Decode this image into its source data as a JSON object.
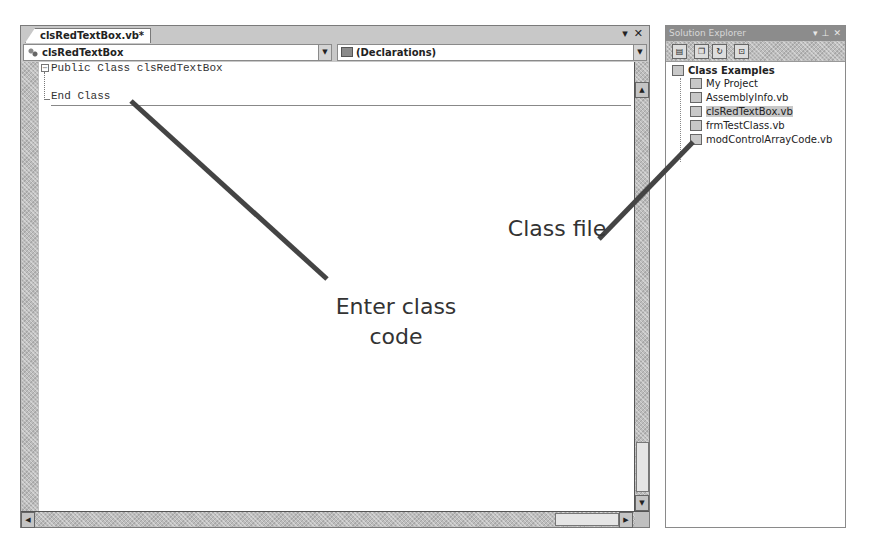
{
  "editor": {
    "tab_label": "clsRedTextBox.vb*",
    "tab_controls": {
      "dropdown": "▾",
      "close": "✕"
    },
    "class_combo": {
      "selected": "clsRedTextBox",
      "icon": "class-icon",
      "arrow": "▼"
    },
    "member_combo": {
      "selected": "(Declarations)",
      "icon": "declarations-icon",
      "arrow": "▼"
    },
    "code_lines": [
      "Public Class clsRedTextBox",
      "",
      "End Class"
    ],
    "fold_glyph": "−",
    "scroll": {
      "up": "▲",
      "down": "▼",
      "left": "◀",
      "right": "▶"
    }
  },
  "solution_explorer": {
    "title": "Solution Explorer",
    "title_controls": {
      "dropdown": "▾",
      "pin": "⊥",
      "close": "✕"
    },
    "toolbar": [
      {
        "name": "properties-button",
        "glyph": "▤"
      },
      {
        "name": "show-all-files-button",
        "glyph": "❐"
      },
      {
        "name": "refresh-button",
        "glyph": "↻"
      },
      {
        "name": "view-code-button",
        "glyph": "⊡"
      }
    ],
    "tree": {
      "root": "Class Examples",
      "items": [
        {
          "label": "My Project",
          "selected": false
        },
        {
          "label": "AssemblyInfo.vb",
          "selected": false
        },
        {
          "label": "clsRedTextBox.vb",
          "selected": true
        },
        {
          "label": "frmTestClass.vb",
          "selected": false
        },
        {
          "label": "modControlArrayCode.vb",
          "selected": false
        }
      ]
    }
  },
  "callouts": {
    "enter_class_code": {
      "line1": "Enter class",
      "line2": "code"
    },
    "class_file": "Class file",
    "line_color": "#444444"
  }
}
